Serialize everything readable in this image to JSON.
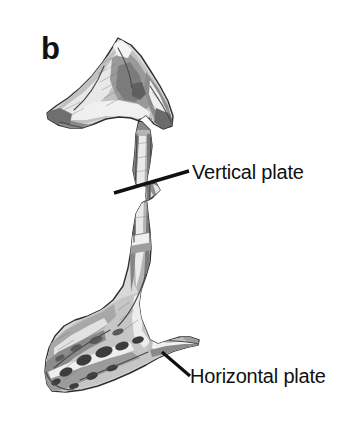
{
  "figure": {
    "panel_letter": "b",
    "background_color": "#ffffff",
    "ink_color": "#101010"
  },
  "annotations": [
    {
      "id": "vertical-plate",
      "label": "Vertical plate",
      "leader_from": [
        114,
        193
      ],
      "leader_to": [
        189,
        171
      ]
    },
    {
      "id": "horizontal-plate",
      "label": "Horizontal plate",
      "leader_from": [
        162,
        352
      ],
      "leader_to": [
        190,
        376
      ]
    }
  ],
  "illustration": {
    "tones": {
      "outline": "#2b2b2b",
      "shadow_dark": "#5e5e5e",
      "shadow_mid": "#8e8e8e",
      "shadow_light": "#b8b8b8",
      "highlight": "#f2f2f2",
      "cavity": "#3a3a3a"
    }
  }
}
